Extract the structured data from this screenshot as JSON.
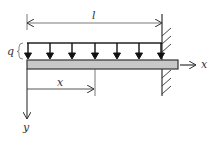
{
  "figure": {
    "type": "cantilever-beam-uniform-load",
    "labels": {
      "length": "l",
      "load": "q",
      "x_axis": "x",
      "y_axis": "y",
      "position": "x"
    },
    "load_arrow_count": 7,
    "colors": {
      "stroke": "#222222",
      "beam_fill": "#c8c8c8",
      "background": "#ffffff"
    }
  }
}
